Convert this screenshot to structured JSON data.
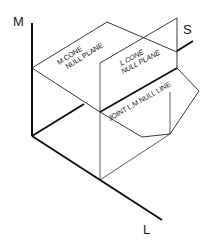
{
  "axes": {
    "m": {
      "label": "M"
    },
    "s": {
      "label": "S"
    },
    "l": {
      "label": "L"
    }
  },
  "planes": {
    "m_cone": {
      "line1": "M CONE",
      "line2": "NULL PLANE"
    },
    "l_cone": {
      "line1": "L CONE",
      "line2": "NULL PLANE"
    },
    "joint": {
      "label": "JOINT L,M NULL LINE"
    }
  },
  "colors": {
    "stroke": "#111111",
    "background": "#ffffff"
  }
}
